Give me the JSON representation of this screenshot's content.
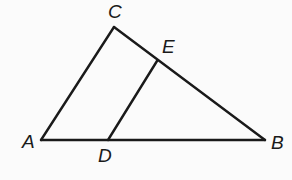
{
  "diagram": {
    "type": "geometry",
    "stroke_color": "#1a1a1a",
    "background_color": "#fbfbfb",
    "points": {
      "A": {
        "label": "A",
        "x": 41,
        "y": 140,
        "label_x": 22,
        "label_y": 148
      },
      "B": {
        "label": "B",
        "x": 265,
        "y": 140,
        "label_x": 271,
        "label_y": 149
      },
      "C": {
        "label": "C",
        "x": 114,
        "y": 27,
        "label_x": 108,
        "label_y": 18
      },
      "D": {
        "label": "D",
        "x": 108,
        "y": 140,
        "label_x": 98,
        "label_y": 162
      },
      "E": {
        "label": "E",
        "x": 157,
        "y": 61,
        "label_x": 162,
        "label_y": 53
      }
    },
    "segments": [
      {
        "name": "AC",
        "from": "A",
        "to": "C"
      },
      {
        "name": "CB",
        "from": "C",
        "to": "B"
      },
      {
        "name": "AB",
        "from": "A",
        "to": "B"
      },
      {
        "name": "DE",
        "from": "D",
        "to": "E"
      }
    ]
  }
}
